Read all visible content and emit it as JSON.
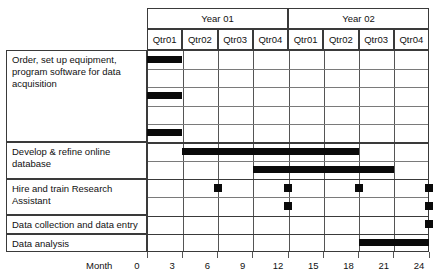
{
  "chart_data": {
    "type": "bar",
    "title": "",
    "xlabel": "Month",
    "ylabel": "",
    "xlim": [
      0,
      24
    ],
    "grid": true,
    "legend": "none",
    "x_ticks": [
      0,
      3,
      6,
      9,
      12,
      15,
      18,
      21,
      24
    ],
    "years": [
      {
        "label": "Year 01",
        "quarters": [
          "Qtr01",
          "Qtr02",
          "Qtr03",
          "Qtr04"
        ]
      },
      {
        "label": "Year 02",
        "quarters": [
          "Qtr01",
          "Qtr02",
          "Qtr03",
          "Qtr04"
        ]
      }
    ],
    "quarter_labels": [
      "Qtr01",
      "Qtr02",
      "Qtr03",
      "Qtr04",
      "Qtr01",
      "Qtr02",
      "Qtr03",
      "Qtr04"
    ],
    "tasks": [
      {
        "name": "Order, set up equipment, program software for data acquisition",
        "subrows": 5,
        "bars": [
          {
            "row": 0,
            "start": 0,
            "end": 3
          },
          {
            "row": 2,
            "start": 0,
            "end": 3
          },
          {
            "row": 4,
            "start": 0,
            "end": 3
          }
        ],
        "milestones": []
      },
      {
        "name": "Develop & refine online database",
        "subrows": 2,
        "bars": [
          {
            "row": 0,
            "start": 3,
            "end": 18
          },
          {
            "row": 1,
            "start": 9,
            "end": 21
          }
        ],
        "milestones": []
      },
      {
        "name": "Hire and train Research Assistant",
        "subrows": 2,
        "bars": [],
        "milestones": [
          {
            "row": 0,
            "month": 6
          },
          {
            "row": 0,
            "month": 12
          },
          {
            "row": 0,
            "month": 18
          },
          {
            "row": 0,
            "month": 24
          },
          {
            "row": 1,
            "month": 12
          },
          {
            "row": 1,
            "month": 24
          }
        ]
      },
      {
        "name": "Data collection and data entry",
        "subrows": 1,
        "bars": [],
        "milestones": [
          {
            "row": 0,
            "month": 24
          }
        ]
      },
      {
        "name": "Data analysis",
        "subrows": 1,
        "bars": [
          {
            "row": 0,
            "start": 18,
            "end": 24
          }
        ],
        "milestones": []
      }
    ]
  },
  "task_label_lines": [
    [
      "Order, set up equipment,",
      "program software for data",
      "acquisition"
    ],
    [
      "Develop & refine online",
      "database"
    ],
    [
      "Hire and train Research",
      "Assistant"
    ],
    [
      "Data collection and data entry"
    ],
    [
      "Data analysis"
    ]
  ],
  "colors": {
    "bar": "#0a0a0a",
    "grid": "#7a7a7a",
    "border": "#3a3a3a",
    "text": "#111111",
    "background": "#ffffff"
  }
}
